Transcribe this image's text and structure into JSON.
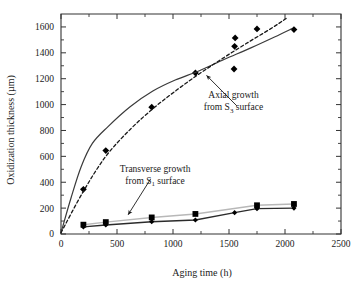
{
  "chart_data": {
    "type": "scatter",
    "title": "",
    "xlabel": "Aging time (h)",
    "ylabel": "Oxidization thickness (µm)",
    "xlim": [
      0,
      2500
    ],
    "ylim": [
      0,
      1700
    ],
    "xticks": [
      0,
      500,
      1000,
      1500,
      2000,
      2500
    ],
    "xticklabels": [
      "0",
      "500",
      "1000",
      "1500",
      "2000",
      "2500"
    ],
    "yticks": [
      0,
      200,
      400,
      600,
      800,
      1000,
      1200,
      1400,
      1600
    ],
    "yticklabels": [
      "0",
      "200",
      "400",
      "600",
      "800",
      "1000",
      "1200",
      "1400",
      "1600"
    ],
    "x_minor_tick_step": 250,
    "y_minor_tick_step": 100,
    "grid": false,
    "legend": false,
    "series": [
      {
        "name": "Axial growth from S3 surface (data)",
        "marker": "diamond",
        "style": "markers",
        "color": "#000000",
        "points": [
          {
            "x": 200,
            "y": 345
          },
          {
            "x": 400,
            "y": 645
          },
          {
            "x": 810,
            "y": 980
          },
          {
            "x": 1200,
            "y": 1245
          },
          {
            "x": 1545,
            "y": 1275
          },
          {
            "x": 1550,
            "y": 1450
          },
          {
            "x": 1555,
            "y": 1515
          },
          {
            "x": 1750,
            "y": 1585
          },
          {
            "x": 2080,
            "y": 1580
          }
        ]
      },
      {
        "name": "Axial growth model (solid curve)",
        "marker": "none",
        "style": "solid-line",
        "color": "#3a3a3a",
        "points": [
          {
            "x": 0,
            "y": 10
          },
          {
            "x": 90,
            "y": 280
          },
          {
            "x": 180,
            "y": 520
          },
          {
            "x": 280,
            "y": 700
          },
          {
            "x": 420,
            "y": 830
          },
          {
            "x": 620,
            "y": 985
          },
          {
            "x": 820,
            "y": 1105
          },
          {
            "x": 1020,
            "y": 1190
          },
          {
            "x": 1230,
            "y": 1260
          },
          {
            "x": 1460,
            "y": 1350
          },
          {
            "x": 1700,
            "y": 1440
          },
          {
            "x": 1950,
            "y": 1540
          },
          {
            "x": 2060,
            "y": 1585
          }
        ]
      },
      {
        "name": "Axial growth model (dashed curve)",
        "marker": "none",
        "style": "dashed-line",
        "color": "#1a1a1a",
        "points": [
          {
            "x": 0,
            "y": 10
          },
          {
            "x": 200,
            "y": 330
          },
          {
            "x": 400,
            "y": 600
          },
          {
            "x": 620,
            "y": 810
          },
          {
            "x": 830,
            "y": 975
          },
          {
            "x": 1030,
            "y": 1110
          },
          {
            "x": 1230,
            "y": 1235
          },
          {
            "x": 1440,
            "y": 1355
          },
          {
            "x": 1650,
            "y": 1470
          },
          {
            "x": 1870,
            "y": 1585
          },
          {
            "x": 2010,
            "y": 1665
          }
        ]
      },
      {
        "name": "Transverse growth from S1 surface (squares)",
        "marker": "square",
        "style": "markers-line",
        "color": "#000000",
        "line_color": "#b8b8b8",
        "points": [
          {
            "x": 200,
            "y": 72
          },
          {
            "x": 400,
            "y": 92
          },
          {
            "x": 810,
            "y": 128
          },
          {
            "x": 1200,
            "y": 155
          },
          {
            "x": 1750,
            "y": 222
          },
          {
            "x": 2080,
            "y": 232
          }
        ]
      },
      {
        "name": "Transverse growth from S1 surface (diamonds)",
        "marker": "diamond",
        "style": "markers-line",
        "color": "#000000",
        "line_color": "#2b2b2b",
        "points": [
          {
            "x": 200,
            "y": 55
          },
          {
            "x": 400,
            "y": 70
          },
          {
            "x": 810,
            "y": 95
          },
          {
            "x": 1200,
            "y": 108
          },
          {
            "x": 1550,
            "y": 165
          },
          {
            "x": 1750,
            "y": 196
          },
          {
            "x": 2080,
            "y": 200
          }
        ]
      }
    ],
    "annotations": [
      {
        "id": "axial-annotation",
        "line1": "Axial growth",
        "line2_prefix": "from S",
        "line2_sub": "3",
        "line2_suffix": " surface",
        "text_x": 1540,
        "text_y": 1050,
        "arrow_from_x": 1570,
        "arrow_from_y": 990,
        "arrow_to_x": 1300,
        "arrow_to_y": 1225
      },
      {
        "id": "transverse-annotation",
        "line1": "Transverse growth",
        "line2_prefix": "from S",
        "line2_sub": "1",
        "line2_suffix": " surface",
        "text_x": 840,
        "text_y": 480,
        "arrow_from_x": 800,
        "arrow_from_y": 425,
        "arrow_to_x": 600,
        "arrow_to_y": 150
      }
    ]
  }
}
